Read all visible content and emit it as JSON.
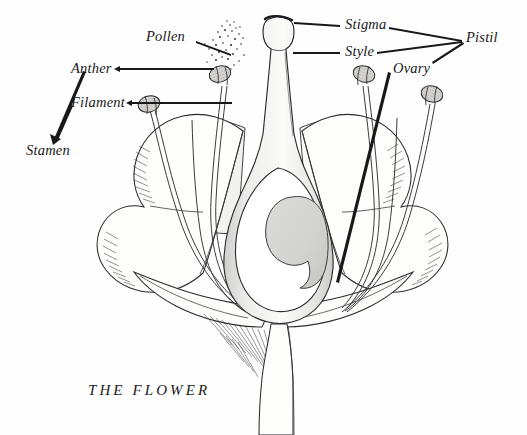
{
  "figure": {
    "caption": "THE FLOWER",
    "style": "pen-and-ink botanical line drawing, longitudinal section",
    "background_color": "#fefefe",
    "ink_color": "#18181a",
    "shading_color": "#d8d8d6"
  },
  "labels": [
    {
      "id": "pollen",
      "text": "Pollen",
      "x": 146,
      "y": 36,
      "points_to": "pollen-dot-cloud",
      "leader": true
    },
    {
      "id": "anther",
      "text": "Anther",
      "x": 71,
      "y": 62,
      "points_to": "anther-upper-left",
      "leader": true
    },
    {
      "id": "filament",
      "text": "Filament",
      "x": 71,
      "y": 96,
      "points_to": "anther-lower-left",
      "leader": true
    },
    {
      "id": "stamen",
      "text": "Stamen",
      "x": 26,
      "y": 146,
      "points_to": "anther-and-filament-group",
      "leader": true
    },
    {
      "id": "stigma",
      "text": "Stigma",
      "x": 345,
      "y": 24,
      "points_to": "stigma-cap",
      "leader": true
    },
    {
      "id": "style",
      "text": "Style",
      "x": 345,
      "y": 50,
      "points_to": "style-column",
      "leader": true
    },
    {
      "id": "ovary",
      "text": "Ovary",
      "x": 393,
      "y": 68,
      "points_to": "ovary-chamber",
      "leader": true
    },
    {
      "id": "pistil",
      "text": "Pistil",
      "x": 466,
      "y": 37,
      "points_to": "stigma-style-ovary-group",
      "leader": true
    }
  ],
  "parts": {
    "stigma": "flattened lobed cap at top of pistil",
    "style": "slender column connecting stigma to ovary",
    "ovary": "swollen basal chamber containing ovules",
    "anther": "stippled two-lobed pollen sac",
    "filament": "slender stalk supporting the anther",
    "stamen": "anther plus filament",
    "pistil": "stigma plus style plus ovary",
    "pollen": "scattered dots released above the anther",
    "petals": "four wavy lobed petals, hatched shading",
    "sepals": "curved bracts below the petals",
    "receptacle": "hatched base tapering into the stem",
    "stem": "vertical stalk at bottom"
  },
  "anther_count": 4,
  "petal_count": 4
}
